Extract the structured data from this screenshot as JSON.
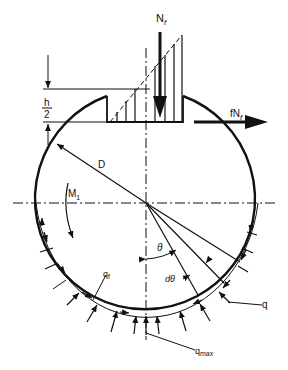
{
  "figure": {
    "type": "mechanical free-body diagram",
    "colors": {
      "ink": "#111111",
      "background": "#ffffff"
    }
  },
  "labels": {
    "normal_force": "N",
    "normal_force_sub": "f",
    "friction_force": "fN",
    "friction_force_sub": "f",
    "half_height_num": "h",
    "half_height_den": "2",
    "diameter": "D",
    "moment": "M",
    "moment_sub": "1",
    "angle": "θ",
    "angle_increment": "dθ",
    "friction_pressure": "q",
    "friction_pressure_sub": "f",
    "pressure": "q",
    "max_pressure": "q",
    "max_pressure_sub": "max"
  }
}
